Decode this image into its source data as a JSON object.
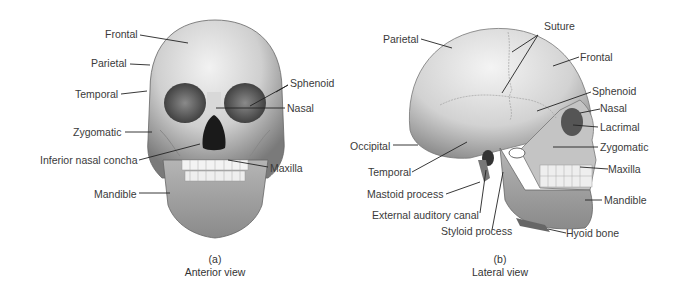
{
  "figure": {
    "panels": [
      {
        "id": "a",
        "letter": "(a)",
        "title": "Anterior view",
        "labels": [
          "Frontal",
          "Parietal",
          "Temporal",
          "Zygomatic",
          "Inferior nasal concha",
          "Mandible",
          "Sphenoid",
          "Nasal",
          "Maxilla"
        ]
      },
      {
        "id": "b",
        "letter": "(b)",
        "title": "Lateral view",
        "labels": [
          "Parietal",
          "Suture",
          "Frontal",
          "Sphenoid",
          "Nasal",
          "Lacrimal",
          "Occipital",
          "Zygomatic",
          "Temporal",
          "Maxilla",
          "Mastoid process",
          "Mandible",
          "External auditory canal",
          "Styloid process",
          "Hyoid bone"
        ]
      }
    ]
  },
  "anterior": {
    "frontal": "Frontal",
    "parietal": "Parietal",
    "temporal": "Temporal",
    "zygomatic": "Zygomatic",
    "inferior_nasal_concha": "Inferior nasal concha",
    "mandible": "Mandible",
    "sphenoid": "Sphenoid",
    "nasal": "Nasal",
    "maxilla": "Maxilla",
    "letter": "(a)",
    "caption": "Anterior view"
  },
  "lateral": {
    "parietal": "Parietal",
    "suture": "Suture",
    "frontal": "Frontal",
    "sphenoid": "Sphenoid",
    "nasal": "Nasal",
    "lacrimal": "Lacrimal",
    "occipital": "Occipital",
    "zygomatic": "Zygomatic",
    "temporal": "Temporal",
    "maxilla": "Maxilla",
    "mastoid_process": "Mastoid process",
    "mandible": "Mandible",
    "external_auditory_canal": "External auditory canal",
    "styloid_process": "Styloid process",
    "hyoid_bone": "Hyoid bone",
    "letter": "(b)",
    "caption": "Lateral view"
  }
}
